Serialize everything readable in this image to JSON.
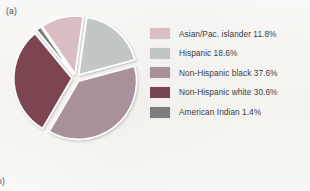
{
  "figure": {
    "panel_label_a": "(a)",
    "panel_label_b": "b)"
  },
  "chart_data": {
    "type": "pie",
    "title": "",
    "categories": [
      "Asian/Pac. islander",
      "Hispanic",
      "Non-Hispanic black",
      "Non-Hispanic white",
      "American Indian"
    ],
    "values": [
      11.8,
      18.6,
      37.6,
      30.6,
      1.4
    ],
    "value_unit": "%",
    "colors": [
      "#d9bfc3",
      "#c3c6c6",
      "#a8919a",
      "#7b4550",
      "#7d7d7d"
    ],
    "legend_position": "right",
    "exploded": true,
    "grid": false,
    "labels": [
      "Asian/Pac. islander 11.8%",
      "Hispanic 18.6%",
      "Non-Hispanic black 37.6%",
      "Non-Hispanic white 30.6%",
      "American Indian 1.4%"
    ]
  },
  "legend": {
    "items": [
      {
        "label": "Asian/Pac. islander 11.8%",
        "color": "#d9bfc3"
      },
      {
        "label": "Hispanic 18.6%",
        "color": "#c3c6c6"
      },
      {
        "label": "Non-Hispanic black 37.6%",
        "color": "#a8919a"
      },
      {
        "label": "Non-Hispanic white 30.6%",
        "color": "#7b4550"
      },
      {
        "label": "American Indian 1.4%",
        "color": "#7d7d7d"
      }
    ]
  }
}
